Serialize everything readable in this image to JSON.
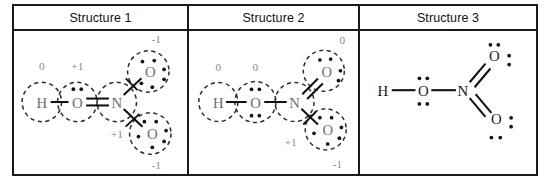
{
  "table": {
    "headers": [
      {
        "label": "Structure 1"
      },
      {
        "label": "Structure 2"
      },
      {
        "label": "Structure 3"
      }
    ]
  },
  "structures": [
    {
      "id": "structure-1",
      "style": "formal-charge-circles",
      "atoms": [
        {
          "symbol": "H",
          "charge": "0",
          "lone_pairs": 0
        },
        {
          "symbol": "O",
          "charge": "+1",
          "lone_pairs": 1
        },
        {
          "symbol": "N",
          "charge": "+1",
          "lone_pairs": 0
        },
        {
          "symbol": "O",
          "charge": "-1",
          "lone_pairs": 3
        },
        {
          "symbol": "O",
          "charge": "-1",
          "lone_pairs": 3
        }
      ],
      "bonds": [
        {
          "from": "H",
          "to": "O",
          "order": 1
        },
        {
          "from": "O",
          "to": "N",
          "order": 2
        },
        {
          "from": "N",
          "to": "O-top",
          "order": 1
        },
        {
          "from": "N",
          "to": "O-bottom",
          "order": 1
        }
      ]
    },
    {
      "id": "structure-2",
      "style": "formal-charge-circles",
      "atoms": [
        {
          "symbol": "H",
          "charge": "0",
          "lone_pairs": 0
        },
        {
          "symbol": "O",
          "charge": "0",
          "lone_pairs": 2
        },
        {
          "symbol": "N",
          "charge": "+1",
          "lone_pairs": 0
        },
        {
          "symbol": "O",
          "charge": "0",
          "lone_pairs": 2
        },
        {
          "symbol": "O",
          "charge": "-1",
          "lone_pairs": 3
        }
      ],
      "bonds": [
        {
          "from": "H",
          "to": "O",
          "order": 1
        },
        {
          "from": "O",
          "to": "N",
          "order": 1
        },
        {
          "from": "N",
          "to": "O-top",
          "order": 2
        },
        {
          "from": "N",
          "to": "O-bottom",
          "order": 1
        }
      ]
    },
    {
      "id": "structure-3",
      "style": "plain-lewis",
      "atoms": [
        {
          "symbol": "H",
          "charge": "",
          "lone_pairs": 0
        },
        {
          "symbol": "O",
          "charge": "",
          "lone_pairs": 2
        },
        {
          "symbol": "N",
          "charge": "",
          "lone_pairs": 0
        },
        {
          "symbol": "O",
          "charge": "",
          "lone_pairs": 2
        },
        {
          "symbol": "O",
          "charge": "",
          "lone_pairs": 2
        }
      ],
      "bonds": [
        {
          "from": "H",
          "to": "O",
          "order": 1
        },
        {
          "from": "O",
          "to": "N",
          "order": 1
        },
        {
          "from": "N",
          "to": "O-top",
          "order": 2
        },
        {
          "from": "N",
          "to": "O-bottom",
          "order": 2
        }
      ]
    }
  ],
  "labels": {
    "s1": {
      "h": "H",
      "o_center": "O",
      "n": "N",
      "o_top": "O",
      "o_bottom": "O",
      "q_h": "0",
      "q_o": "+1",
      "q_n": "+1",
      "q_otop": "-1",
      "q_obot": "-1"
    },
    "s2": {
      "h": "H",
      "o_center": "O",
      "n": "N",
      "o_top": "O",
      "o_bottom": "O",
      "q_h": "0",
      "q_o": "0",
      "q_n": "+1",
      "q_otop": "0",
      "q_obot": "-1"
    },
    "s3": {
      "h": "H",
      "o_center": "O",
      "n": "N",
      "o_top": "O",
      "o_bottom": "O"
    }
  },
  "colors": {
    "border": "#1a1a1a",
    "atom_gray": "#6e6e6e",
    "atom_black": "#1a1a1a",
    "charge_gray": "#8a8a8a",
    "dot": "#111111",
    "background": "#ffffff"
  }
}
